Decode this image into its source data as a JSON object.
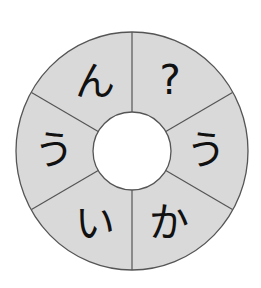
{
  "puzzle": {
    "type": "hiragana-ring",
    "center": [
      132,
      151
    ],
    "outer_radius": [
      116,
      119
    ],
    "inner_radius": 39,
    "label_radius": 78,
    "colors": {
      "background": "#ffffff",
      "ring_fill": "#d9d9d9",
      "stroke": "#555555",
      "text": "#111111",
      "hole": "#ffffff"
    },
    "divider_angles_deg": [
      90,
      30,
      -30,
      -90,
      -150,
      150
    ],
    "segments": [
      {
        "position": "top-left",
        "angle_deg": 120,
        "char": "ん"
      },
      {
        "position": "top-right",
        "angle_deg": 60,
        "char": "?"
      },
      {
        "position": "right",
        "angle_deg": 0,
        "char": "う"
      },
      {
        "position": "bottom-right",
        "angle_deg": -60,
        "char": "か"
      },
      {
        "position": "bottom-left",
        "angle_deg": -120,
        "char": "い"
      },
      {
        "position": "left",
        "angle_deg": 180,
        "char": "う"
      }
    ]
  }
}
